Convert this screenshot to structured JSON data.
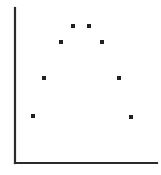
{
  "figure": {
    "width": 161,
    "height": 175,
    "background_color": "#ffffff"
  },
  "axes": {
    "line_color": "#2b2b2b",
    "line_width": 2.2,
    "y_axis": {
      "x": 15,
      "y_top": 8,
      "y_bottom": 163
    },
    "x_axis": {
      "y": 163,
      "x_left": 15,
      "x_right": 157
    },
    "ticks": "none",
    "tick_labels": "none",
    "spines": "left-and-bottom-only"
  },
  "chart_data": {
    "type": "scatter",
    "title": "",
    "subtitle": "",
    "xlabel": "",
    "ylabel": "",
    "xlim": [
      15,
      157
    ],
    "ylim": [
      8,
      163
    ],
    "grid": false,
    "legend": "none",
    "legend_position": "none",
    "annotations": [],
    "marker": {
      "shape": "square",
      "size_px": 4,
      "color": "#202020"
    },
    "n_points": 8,
    "points": [
      {
        "id": "p1",
        "x": 33,
        "y": 116,
        "label": "bottom-left"
      },
      {
        "id": "p2",
        "x": 44,
        "y": 78,
        "label": "lower-left"
      },
      {
        "id": "p3",
        "x": 61,
        "y": 42,
        "label": "upper-left"
      },
      {
        "id": "p4",
        "x": 73,
        "y": 26,
        "label": "top-left"
      },
      {
        "id": "p5",
        "x": 89,
        "y": 26,
        "label": "top-right"
      },
      {
        "id": "p6",
        "x": 102,
        "y": 42,
        "label": "upper-right"
      },
      {
        "id": "p7",
        "x": 119,
        "y": 78,
        "label": "lower-right"
      },
      {
        "id": "p8",
        "x": 131,
        "y": 117,
        "label": "bottom-right"
      }
    ],
    "x": [
      33,
      44,
      61,
      73,
      89,
      102,
      119,
      131
    ],
    "y": [
      116,
      78,
      42,
      26,
      26,
      42,
      78,
      117
    ]
  }
}
